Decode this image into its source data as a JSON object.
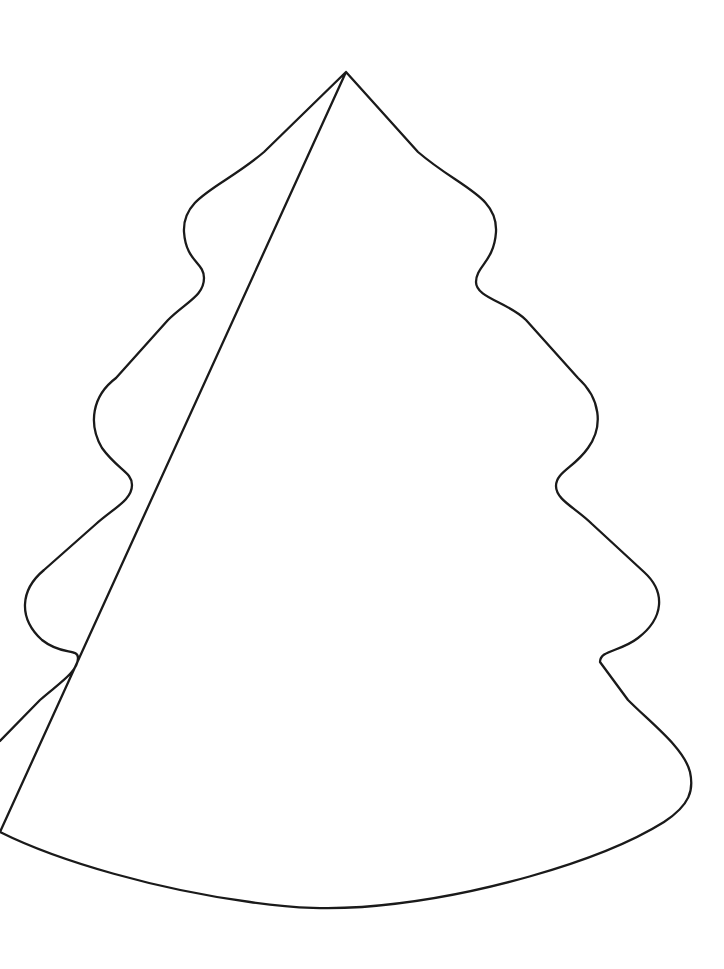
{
  "document": {
    "kind": "line-art-coloring-page",
    "subject": "christmas-tree-outline",
    "background_color": "#ffffff",
    "stroke_color": "#1a1a1a",
    "stroke_width": 2.3,
    "fill_color": "#ffffff",
    "canvas": {
      "width": 724,
      "height": 969
    },
    "accessible_label": "Outline drawing of a christmas tree",
    "clipped_edges": "left"
  },
  "artwork": {
    "name": "christmas-tree-outline",
    "apex": {
      "x": 346,
      "y": 72
    },
    "baseline_lowest": {
      "x": 345,
      "y": 908
    },
    "rightmost": {
      "x": 692,
      "y": 795
    },
    "left_exit": {
      "x": 0,
      "y": 741
    },
    "left_reentry": {
      "x": 0,
      "y": 832
    },
    "tiers": 4,
    "path": "M 346 72 L 264 152 C 222 188 182 196 184 232 C 186 262 204 262 204 278 C 204 296 186 302 168 320 L 116 378 C 92 396 88 424 102 448 C 118 470 132 472 132 485 C 132 500 114 508 96 524 L 44 570 C 20 590 18 618 42 640 C 62 656 78 648 78 658 C 78 672 58 684 40 700 L 0 741 M 0 832 C 60 862 160 890 250 902 C 300 909 330 909 362 907 C 470 899 600 862 664 822 C 690 805 694 790 690 772 C 684 748 652 724 628 700 L 600 662 C 600 650 620 652 638 638 C 664 618 666 592 644 572 L 592 524 C 576 508 556 500 556 486 C 556 472 574 468 588 448 C 604 426 600 398 578 378 L 526 320 C 508 302 476 298 476 282 C 476 266 494 262 496 232 C 498 196 460 188 418 152 L 346 72 Z"
  }
}
